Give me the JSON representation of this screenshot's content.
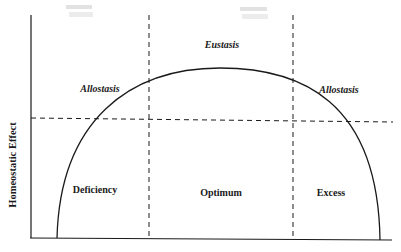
{
  "diagram": {
    "y_axis_label": "Homeostatic Effect",
    "regions": [
      {
        "label": "Deficiency"
      },
      {
        "label": "Optimum"
      },
      {
        "label": "Excess"
      }
    ],
    "curve_labels": {
      "left": "Allostasis",
      "top": "Eustasis",
      "right": "Allostasis"
    },
    "faded_marks": {
      "left": "",
      "right": ""
    },
    "colors": {
      "line": "#1a1a1a",
      "background": "#ffffff"
    }
  }
}
